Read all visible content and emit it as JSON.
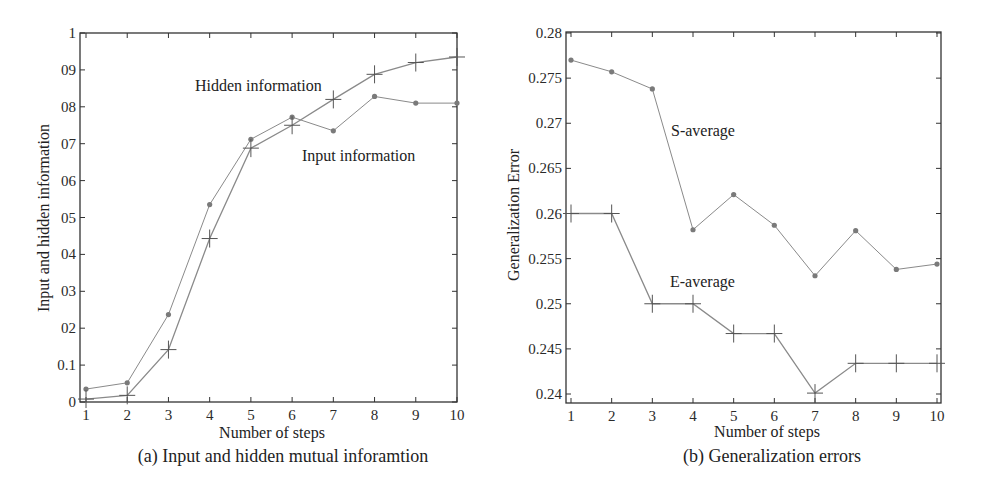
{
  "chart_data": [
    {
      "type": "line",
      "caption": "(a) Input and hidden mutual inforamtion",
      "title": "",
      "xlabel": "Number of steps",
      "ylabel": "Input and hidden information",
      "x": [
        1,
        2,
        3,
        4,
        5,
        6,
        7,
        8,
        9,
        10
      ],
      "xlim": [
        1,
        10
      ],
      "ylim": [
        0,
        1
      ],
      "xticks": [
        "1",
        "2",
        "3",
        "4",
        "5",
        "6",
        "7",
        "8",
        "9",
        "10"
      ],
      "yticks": [
        "0",
        "0.1",
        "0.2",
        "0.3",
        "0.4",
        "0.5",
        "0.6",
        "0.7",
        "0.8",
        "0.9",
        "1"
      ],
      "ytick_labels_as_printed": [
        "0",
        "0.1",
        "02",
        "03",
        "04",
        "05",
        "06",
        "07",
        "08",
        "09",
        "1"
      ],
      "grid": false,
      "legend": "inline annotations",
      "series": [
        {
          "name": "Input information",
          "marker": "dot",
          "values": [
            0.035,
            0.052,
            0.237,
            0.535,
            0.712,
            0.772,
            0.735,
            0.828,
            0.81,
            0.81
          ]
        },
        {
          "name": "Hidden information",
          "marker": "plus",
          "values": [
            0.008,
            0.018,
            0.142,
            0.443,
            0.688,
            0.75,
            0.82,
            0.888,
            0.92,
            0.935
          ]
        }
      ]
    },
    {
      "type": "line",
      "caption": "(b) Generalization errors",
      "title": "",
      "xlabel": "Number of steps",
      "ylabel": "Generalization Error",
      "x": [
        1,
        2,
        3,
        4,
        5,
        6,
        7,
        8,
        9,
        10
      ],
      "xlim": [
        1,
        10
      ],
      "ylim": [
        0.24,
        0.28
      ],
      "xticks": [
        "1",
        "2",
        "3",
        "4",
        "5",
        "6",
        "7",
        "8",
        "9",
        "10"
      ],
      "yticks": [
        "0.24",
        "0.245",
        "0.25",
        "0.255",
        "0.26",
        "0.265",
        "0.27",
        "0.275",
        "0.28"
      ],
      "grid": false,
      "legend": "inline annotations",
      "series": [
        {
          "name": "S-average",
          "marker": "dot",
          "values": [
            0.277,
            0.2757,
            0.2738,
            0.2582,
            0.2621,
            0.2587,
            0.2531,
            0.2581,
            0.2538,
            0.2544
          ]
        },
        {
          "name": "E-average",
          "marker": "plus",
          "values": [
            0.26,
            0.26,
            0.25,
            0.25,
            0.2467,
            0.2467,
            0.2401,
            0.2434,
            0.2434,
            0.2434
          ]
        }
      ]
    }
  ],
  "charts": {
    "a": {
      "caption": "(a) Input and hidden mutual inforamtion",
      "xlabel": "Number of steps",
      "ylabel": "Input and hidden information",
      "annot_hidden": "Hidden information",
      "annot_input": "Input information"
    },
    "b": {
      "caption": "(b) Generalization errors",
      "xlabel": "Number of steps",
      "ylabel": "Generalization Error",
      "annot_s": "S-average",
      "annot_e": "E-average"
    }
  },
  "colors": {
    "axis": "#333333",
    "series_line": "#8a8a8a",
    "dot_marker": "#7a7a7a",
    "plus_marker": "#555555"
  }
}
